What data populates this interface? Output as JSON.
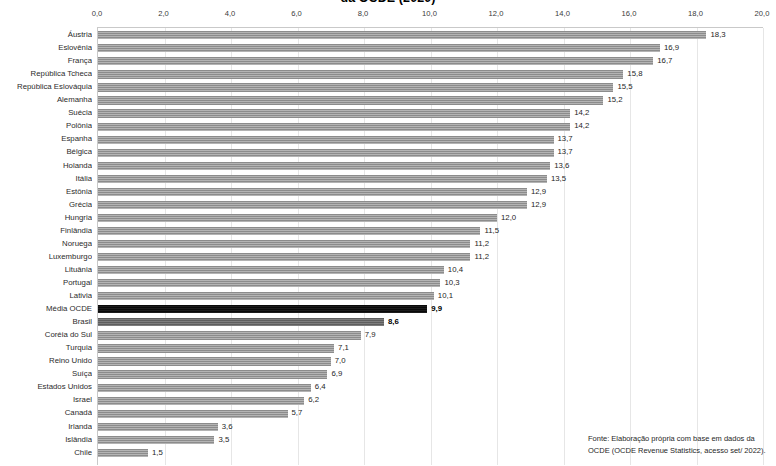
{
  "chart_data": {
    "type": "bar",
    "orientation": "horizontal",
    "title": "da OCDE (2020)",
    "title_note": "title is clipped at the top edge of the screenshot",
    "xlabel": "",
    "ylabel": "",
    "xlim": [
      0.0,
      20.0
    ],
    "xticks": [
      "0,0",
      "2,0",
      "4,0",
      "6,0",
      "8,0",
      "10,0",
      "12,0",
      "14,0",
      "16,0",
      "18,0",
      "20,0"
    ],
    "xtick_values": [
      0,
      2,
      4,
      6,
      8,
      10,
      12,
      14,
      16,
      18,
      20
    ],
    "grid": true,
    "legend": "none",
    "value_label_decimal_separator": ",",
    "categories": [
      "Áustria",
      "Eslovênia",
      "França",
      "República Tcheca",
      "República Eslováquia",
      "Alemanha",
      "Suécia",
      "Polônia",
      "Espanha",
      "Bélgica",
      "Holanda",
      "Itália",
      "Estônia",
      "Grécia",
      "Hungria",
      "Finlândia",
      "Noruega",
      "Luxemburgo",
      "Lituânia",
      "Portugal",
      "Lativia",
      "Média OCDE",
      "Brasil",
      "Coréia do Sul",
      "Turquia",
      "Reino Unido",
      "Suíça",
      "Estados Unidos",
      "Israel",
      "Canadá",
      "Irlanda",
      "Islândia",
      "Chile"
    ],
    "values": [
      18.3,
      16.9,
      16.7,
      15.8,
      15.5,
      15.2,
      14.2,
      14.2,
      13.7,
      13.7,
      13.6,
      13.5,
      12.9,
      12.9,
      12.0,
      11.5,
      11.2,
      11.2,
      10.4,
      10.3,
      10.1,
      9.9,
      8.6,
      7.9,
      7.1,
      7.0,
      6.9,
      6.4,
      6.2,
      5.7,
      3.6,
      3.5,
      1.5
    ],
    "value_labels": [
      "18,3",
      "16,9",
      "16,7",
      "15,8",
      "15,5",
      "15,2",
      "14,2",
      "14,2",
      "13,7",
      "13,7",
      "13,6",
      "13,5",
      "12,9",
      "12,9",
      "12,0",
      "11,5",
      "11,2",
      "11,2",
      "10,4",
      "10,3",
      "10,1",
      "9,9",
      "8,6",
      "7,9",
      "7,1",
      "7,0",
      "6,9",
      "6,4",
      "6,2",
      "5,7",
      "3,6",
      "3,5",
      "1,5"
    ],
    "highlighted_categories": [
      "Média OCDE"
    ],
    "emphasized_categories": [
      "Brasil"
    ],
    "colors": {
      "bar": "#9a9a9a",
      "bar_highlight": "#0d0d0d",
      "bar_emphasis": "#6a6a6a",
      "gridline": "#e6e6e6",
      "text": "#262626"
    }
  },
  "source": {
    "line1": "Fonte:  Elaboração própria com base em dados da",
    "line2": "OCDE (OCDE Revenue Statistics, acesso set/ 2022)."
  }
}
